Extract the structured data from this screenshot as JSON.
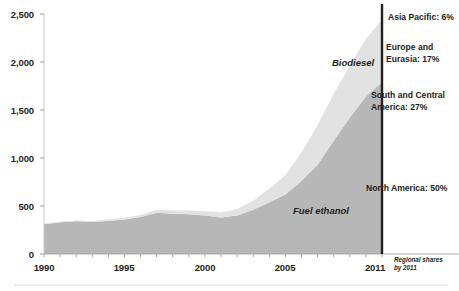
{
  "chart_data": {
    "type": "area",
    "title": "",
    "xlabel": "",
    "ylabel": "",
    "stacked": true,
    "grid": false,
    "legend_position": "inline-annotations",
    "xlim": [
      1990,
      2011
    ],
    "ylim": [
      0,
      2500
    ],
    "x_ticks": [
      "1990",
      "1995",
      "2000",
      "2005",
      "2011"
    ],
    "x_tick_values": [
      1990,
      1995,
      2000,
      2005,
      2011
    ],
    "y_ticks": [
      "0",
      "500",
      "1,000",
      "1,500",
      "2,000",
      "2,500"
    ],
    "y_tick_values": [
      0,
      500,
      1000,
      1500,
      2000,
      2500
    ],
    "x": [
      1990,
      1991,
      1992,
      1993,
      1994,
      1995,
      1996,
      1997,
      1998,
      1999,
      2000,
      2001,
      2002,
      2003,
      2004,
      2005,
      2006,
      2007,
      2008,
      2009,
      2010,
      2011
    ],
    "series": [
      {
        "name": "Fuel ethanol",
        "color": "#b7b7b7",
        "values": [
          310,
          330,
          340,
          335,
          345,
          360,
          385,
          430,
          420,
          415,
          400,
          380,
          400,
          460,
          540,
          620,
          760,
          930,
          1180,
          1420,
          1640,
          1790
        ]
      },
      {
        "name": "Biodiesel",
        "color": "#e2e2e2",
        "values": [
          5,
          6,
          8,
          10,
          14,
          18,
          22,
          28,
          32,
          38,
          45,
          55,
          70,
          95,
          140,
          200,
          300,
          410,
          490,
          540,
          600,
          650
        ]
      }
    ],
    "series_labels": [
      {
        "name": "Biodiesel",
        "text": "Biodiesel"
      },
      {
        "name": "Fuel ethanol",
        "text": "Fuel ethanol"
      }
    ],
    "annotations": [
      {
        "name": "asia-pacific",
        "text": "Asia Pacific: 6%",
        "value": 6,
        "unit": "%"
      },
      {
        "name": "europe-eurasia",
        "line1": "Europe and",
        "line2": "Eurasia: 17%",
        "value": 17,
        "unit": "%"
      },
      {
        "name": "south-central-america",
        "line1": "South and Central",
        "line2": "America: 27%",
        "value": 27,
        "unit": "%"
      },
      {
        "name": "north-america",
        "text": "North America: 50%",
        "value": 50,
        "unit": "%"
      }
    ],
    "caption": {
      "line1": "Regional shares",
      "line2": "by 2011"
    },
    "marker_line": {
      "name": "year-2011-marker",
      "x_value": 2011,
      "color": "#231f20"
    }
  }
}
